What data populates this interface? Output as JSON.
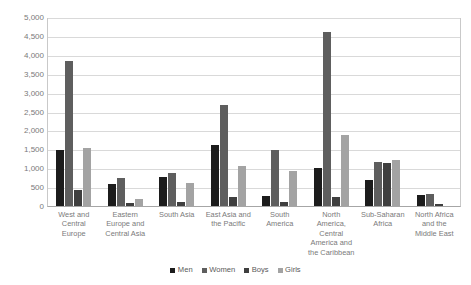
{
  "chart_data": {
    "type": "bar",
    "title": "",
    "xlabel": "",
    "ylabel": "",
    "ylim": [
      0,
      5000
    ],
    "grid": true,
    "legend_position": "bottom",
    "ytick_labels": [
      "0",
      "500",
      "1,000",
      "1,500",
      "2,000",
      "2,500",
      "3,000",
      "3,500",
      "4,000",
      "4,500",
      "5,000"
    ],
    "ytick_values": [
      0,
      500,
      1000,
      1500,
      2000,
      2500,
      3000,
      3500,
      4000,
      4500,
      5000
    ],
    "categories": [
      "West and Central Europe",
      "Eastern Europe and Central Asia",
      "South Asia",
      "East Asia and the Pacific",
      "South America",
      "North America, Central America and the Caribbean",
      "Sub-Saharan Africa",
      "North Africa and the Middle East"
    ],
    "category_lines": [
      [
        "West and",
        "Central",
        "Europe"
      ],
      [
        "Eastern",
        "Europe and",
        "Central Asia"
      ],
      [
        "South Asia"
      ],
      [
        "East Asia and",
        "the Pacific"
      ],
      [
        "South",
        "America"
      ],
      [
        "North",
        "America,",
        "Central",
        "America and",
        "the Caribbean"
      ],
      [
        "Sub-Saharan",
        "Africa"
      ],
      [
        "North Africa",
        "and the",
        "Middle East"
      ]
    ],
    "series": [
      {
        "name": "Men",
        "color": "#1c1c1c",
        "values": [
          1500,
          600,
          770,
          1620,
          270,
          1020,
          700,
          290
        ]
      },
      {
        "name": "Women",
        "color": "#5e5e5e",
        "values": [
          3880,
          760,
          880,
          2710,
          1490,
          4650,
          1180,
          330
        ]
      },
      {
        "name": "Boys",
        "color": "#3f3f3f",
        "values": [
          440,
          90,
          100,
          250,
          110,
          240,
          1140,
          60
        ]
      },
      {
        "name": "Girls",
        "color": "#a3a3a3",
        "values": [
          1560,
          180,
          620,
          1080,
          940,
          1900,
          1230,
          0
        ]
      }
    ]
  },
  "legend": {
    "items": [
      {
        "label": "Men",
        "color": "#1c1c1c"
      },
      {
        "label": "Women",
        "color": "#5e5e5e"
      },
      {
        "label": "Boys",
        "color": "#3f3f3f"
      },
      {
        "label": "Girls",
        "color": "#a3a3a3"
      }
    ]
  },
  "colors": {
    "gridline": "#d9d9d9",
    "axis": "#a6a6a6",
    "tick_text": "#7a7a7a",
    "legend_text": "#595959",
    "background": "#ffffff"
  }
}
